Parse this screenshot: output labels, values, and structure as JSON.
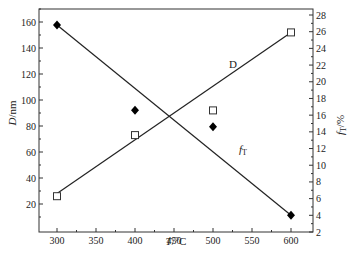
{
  "chart_data": {
    "type": "scatter",
    "title": "",
    "xlabel": "T/°C",
    "ylabel": "D/nm",
    "y2label": "f_T/%",
    "xlim": [
      275,
      625
    ],
    "ylim": [
      10,
      170
    ],
    "y2lim": [
      2,
      29
    ],
    "x_ticks": [
      300,
      350,
      400,
      450,
      500,
      550,
      600
    ],
    "y_ticks": [
      20,
      40,
      60,
      80,
      100,
      120,
      140,
      160
    ],
    "y2_ticks": [
      2,
      4,
      6,
      8,
      10,
      12,
      14,
      16,
      18,
      20,
      22,
      24,
      26,
      28
    ],
    "grid": false,
    "legend": "none (inline line labels)",
    "series": [
      {
        "name": "D",
        "axis": "left",
        "marker": "open-square",
        "x": [
          300,
          400,
          500,
          600
        ],
        "values": [
          26,
          73,
          92,
          152
        ],
        "fit_line": {
          "x": [
            300,
            600
          ],
          "y": [
            28,
            152
          ]
        },
        "label": "D"
      },
      {
        "name": "f_T",
        "axis": "right",
        "marker": "filled-diamond",
        "x": [
          300,
          400,
          500,
          600
        ],
        "values": [
          26.8,
          16.6,
          14.6,
          4.0
        ],
        "fit_line": {
          "x": [
            300,
            600
          ],
          "y": [
            26.8,
            4.0
          ]
        },
        "label": "f_T"
      }
    ]
  },
  "labels": {
    "xlabel_T": "T",
    "xlabel_unit": "/°C",
    "ylabel_D": "D",
    "ylabel_unit": "/nm",
    "y2label_f": "f",
    "y2label_sub": "T",
    "y2label_unit": "/%",
    "series_D": "D",
    "series_f": "f",
    "series_f_sub": "T"
  }
}
